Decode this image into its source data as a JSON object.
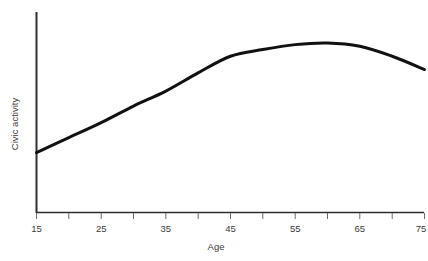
{
  "chart_data": {
    "type": "line",
    "title": "",
    "subtitle": "",
    "xlabel": "Age",
    "ylabel": "Civic activity",
    "x": [
      15,
      20,
      25,
      30,
      35,
      40,
      45,
      50,
      55,
      60,
      65,
      70,
      75
    ],
    "values": [
      0.28,
      0.37,
      0.46,
      0.56,
      0.65,
      0.76,
      0.86,
      0.9,
      0.93,
      0.94,
      0.92,
      0.86,
      0.78
    ],
    "series": [
      {
        "name": "Civic activity",
        "values": [
          0.28,
          0.37,
          0.46,
          0.56,
          0.65,
          0.76,
          0.86,
          0.9,
          0.93,
          0.94,
          0.92,
          0.86,
          0.78
        ]
      }
    ],
    "xlim": [
      15,
      75
    ],
    "ylim": [
      0,
      1
    ],
    "x_tick_values": [
      15,
      20,
      25,
      30,
      35,
      40,
      45,
      50,
      55,
      60,
      65,
      70,
      75
    ],
    "x_tick_labels": [
      "15",
      "",
      "25",
      "",
      "35",
      "",
      "45",
      "",
      "55",
      "",
      "65",
      "",
      "75"
    ],
    "x_labeled_ticks": [
      "15",
      "25",
      "35",
      "45",
      "55",
      "65",
      "75"
    ],
    "y_tick_labels": [],
    "grid": false,
    "legend": false,
    "legend_position": "none",
    "line_color": "#111111",
    "line_width": 3,
    "axis_color": "#3a3a3a",
    "background_color": "#ffffff",
    "annotations": []
  },
  "axes": {
    "x_title": "Age",
    "y_title": "Civic activity"
  },
  "ticks": {
    "t0": "15",
    "t1": "25",
    "t2": "35",
    "t3": "45",
    "t4": "55",
    "t5": "65",
    "t6": "75"
  }
}
